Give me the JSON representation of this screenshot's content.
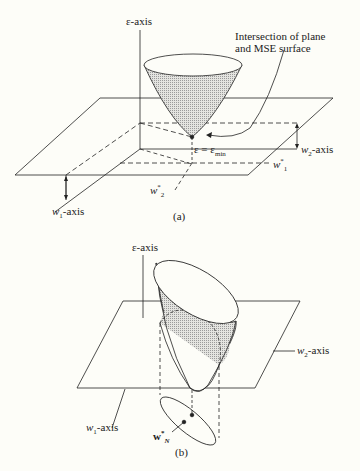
{
  "figure_a": {
    "caption": "(a)",
    "epsilon_axis_label": "ε-axis",
    "annotation_line1": "Intersection of plane",
    "annotation_line2": "and MSE surface",
    "min_label": "ε = ε",
    "min_subscript": "min",
    "w2_axis_label": "-axis",
    "w2_symbol": "w",
    "w2_sub": "2",
    "w1_axis_label": "-axis",
    "w1_symbol": "w",
    "w1_sub": "1",
    "w1_star_symbol": "w",
    "w1_star_sub": "1",
    "w1_star_sup": "*",
    "w2_star_symbol": "w",
    "w2_star_sub": "2",
    "w2_star_sup": "*"
  },
  "figure_b": {
    "caption": "(b)",
    "epsilon_axis_label": "ε-axis",
    "w2_axis_label": "-axis",
    "w2_symbol": "w",
    "w2_sub": "2",
    "w1_axis_label": "-axis",
    "w1_symbol": "w",
    "w1_sub": "1",
    "wn_symbol": "w",
    "wn_sub": "N",
    "wn_sup": "*"
  },
  "colors": {
    "background": "#fdfdf8",
    "ink": "#222222",
    "stipple": "#b8b8b8"
  }
}
